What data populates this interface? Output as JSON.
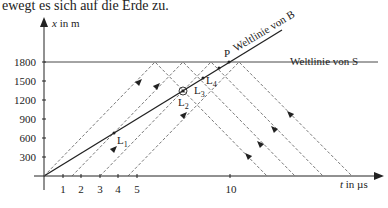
{
  "caption": "ewegt es sich auf die Erde zu.",
  "axes": {
    "y_label_var": "x",
    "y_label_unit": " in m",
    "x_label_var": "t",
    "x_label_unit": " in µs",
    "y_ticks": [
      "300",
      "600",
      "900",
      "1200",
      "1500",
      "1800"
    ],
    "x_ticks": [
      "1",
      "2",
      "3",
      "4",
      "5",
      "10"
    ]
  },
  "labels": {
    "worldline_B": "Weltlinie von B",
    "worldline_S": "Weltlinie von S",
    "point_P": "P",
    "L1": "L",
    "L1_sub": "1",
    "L2": "L",
    "L2_sub": "2",
    "L3": "L",
    "L3_sub": "3",
    "L4": "L",
    "L4_sub": "4"
  },
  "colors": {
    "line": "#222222",
    "dashed": "#555555",
    "background": "#ffffff"
  }
}
